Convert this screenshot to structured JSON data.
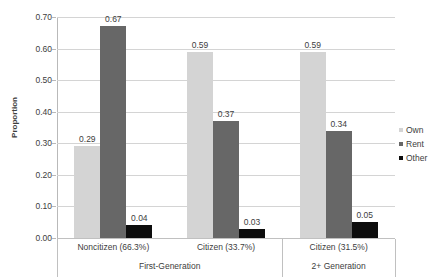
{
  "chart_data": {
    "type": "bar",
    "title": "",
    "xlabel": "",
    "ylabel": "Proportion",
    "ylim": [
      0.0,
      0.7
    ],
    "ytick_labels": [
      "0.00",
      "0.10",
      "0.20",
      "0.30",
      "0.40",
      "0.50",
      "0.60",
      "0.70"
    ],
    "ytick_values": [
      0.0,
      0.1,
      0.2,
      0.3,
      0.4,
      0.5,
      0.6,
      0.7
    ],
    "grid": true,
    "legend_position": "right",
    "categories": [
      "Noncitizen (66.3%)",
      "Citizen (33.7%)",
      "Citizen (31.5%)"
    ],
    "groups": [
      {
        "label": "First-Generation",
        "categories": [
          "Noncitizen (66.3%)",
          "Citizen (33.7%)"
        ]
      },
      {
        "label": "2+ Generation",
        "categories": [
          "Citizen (31.5%)"
        ]
      }
    ],
    "series": [
      {
        "name": "Own",
        "color": "#d4d4d4",
        "values": [
          0.29,
          0.59,
          0.59
        ],
        "labels": [
          "0.29",
          "0.59",
          "0.59"
        ]
      },
      {
        "name": "Rent",
        "color": "#676767",
        "values": [
          0.67,
          0.37,
          0.34
        ],
        "labels": [
          "0.67",
          "0.37",
          "0.34"
        ]
      },
      {
        "name": "Other",
        "color": "#0d0d0d",
        "values": [
          0.04,
          0.03,
          0.05
        ],
        "labels": [
          "0.04",
          "0.03",
          "0.05"
        ]
      }
    ]
  },
  "legend": {
    "items": [
      {
        "label": "Own"
      },
      {
        "label": "Rent"
      },
      {
        "label": "Other"
      }
    ]
  }
}
